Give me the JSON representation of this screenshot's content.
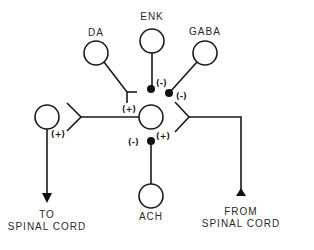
{
  "diagram": {
    "type": "neural-circuit",
    "nodes": {
      "da": {
        "label": "DA"
      },
      "enk": {
        "label": "ENK"
      },
      "gaba": {
        "label": "GABA"
      },
      "ach": {
        "label": "ACH"
      },
      "center": {
        "label": ""
      },
      "output": {
        "label": ""
      }
    },
    "signs": {
      "da_to_center": "(+)",
      "enk_to_center": "(-)",
      "gaba_to_center": "(-)",
      "ach_left": "(-)",
      "ach_right": "(+)",
      "output_from_center": "(+)"
    },
    "io": {
      "to_line1": "TO",
      "to_line2": "SPINAL CORD",
      "from_line1": "FROM",
      "from_line2": "SPINAL CORD"
    },
    "colors": {
      "stroke": "#1a1a1a",
      "background": "#ffffff"
    }
  }
}
